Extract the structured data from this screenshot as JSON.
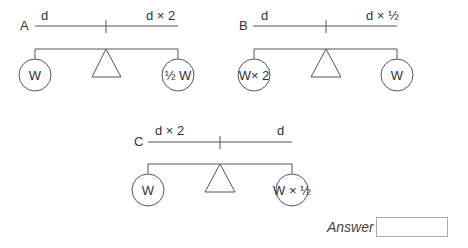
{
  "diagrams": [
    {
      "id": "A",
      "label": "A",
      "left_distance": "d",
      "right_distance": "d × 2",
      "left_weight": "W",
      "right_weight": "½ W"
    },
    {
      "id": "B",
      "label": "B",
      "left_distance": "d",
      "right_distance": "d × ½",
      "left_weight": "W× 2",
      "right_weight": "W"
    },
    {
      "id": "C",
      "label": "C",
      "left_distance": "d × 2",
      "right_distance": "d",
      "left_weight": "W",
      "right_weight": "W × ½"
    }
  ],
  "answer": {
    "label": "Answer",
    "value": ""
  }
}
